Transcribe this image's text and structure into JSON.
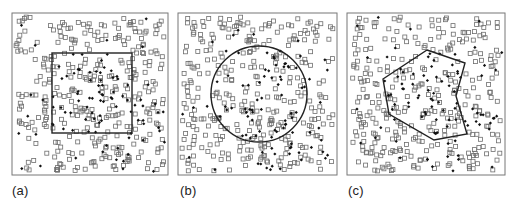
{
  "figure": {
    "background": "#ffffff",
    "frame_color": "#777777",
    "shape_color": "#222222",
    "square_marker_color": "#6e6e6e",
    "filled_marker_color": "#111111",
    "panels": [
      {
        "id": "a",
        "label": "(a)",
        "frame": {
          "x": 12,
          "y": 13,
          "w": 156,
          "h": 162
        },
        "label_pos": {
          "x": 12,
          "y": 183
        },
        "region": {
          "type": "square",
          "x": 52,
          "y": 53,
          "w": 80,
          "h": 80
        },
        "seed": 11
      },
      {
        "id": "b",
        "label": "(b)",
        "frame": {
          "x": 178,
          "y": 13,
          "w": 159,
          "h": 162
        },
        "label_pos": {
          "x": 180,
          "y": 183
        },
        "region": {
          "type": "circle",
          "cx": 259,
          "cy": 94,
          "r": 48
        },
        "seed": 23
      },
      {
        "id": "c",
        "label": "(c)",
        "frame": {
          "x": 347,
          "y": 13,
          "w": 158,
          "h": 162
        },
        "label_pos": {
          "x": 348,
          "y": 183
        },
        "region": {
          "type": "polygon",
          "points": [
            [
              427,
              50
            ],
            [
              465,
              63
            ],
            [
              456,
              96
            ],
            [
              467,
              134
            ],
            [
              434,
              140
            ],
            [
              389,
              114
            ],
            [
              383,
              79
            ]
          ]
        },
        "seed": 37
      }
    ],
    "markers": {
      "hollow_square_count": 330,
      "filled_count": 95,
      "square_size": 4,
      "filled_size": 3.2,
      "legend": {
        "hollow_square": "open squares (background points)",
        "filled": "filled markers (event points)"
      }
    }
  }
}
